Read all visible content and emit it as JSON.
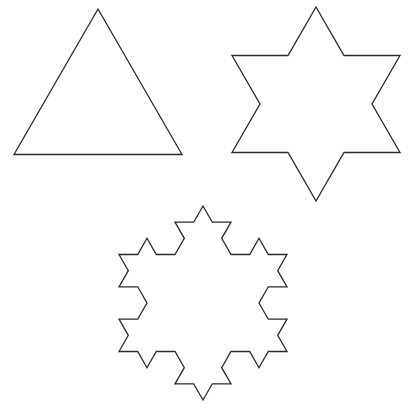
{
  "diagram": {
    "title": "",
    "stroke_color": "#2b2b2b",
    "background": "#ffffff",
    "figures": [
      {
        "name": "koch-iteration-0",
        "kind": "triangle",
        "iteration": 0,
        "center": [
          98,
          106
        ],
        "circumradius": 97,
        "rotation_deg": -90
      },
      {
        "name": "koch-iteration-1",
        "kind": "star",
        "iteration": 1,
        "center": [
          316,
          104
        ],
        "circumradius": 97,
        "rotation_deg": -90
      },
      {
        "name": "koch-iteration-2",
        "kind": "snowflake",
        "iteration": 2,
        "center": [
          203,
          303
        ],
        "circumradius": 97,
        "rotation_deg": -90
      }
    ]
  }
}
